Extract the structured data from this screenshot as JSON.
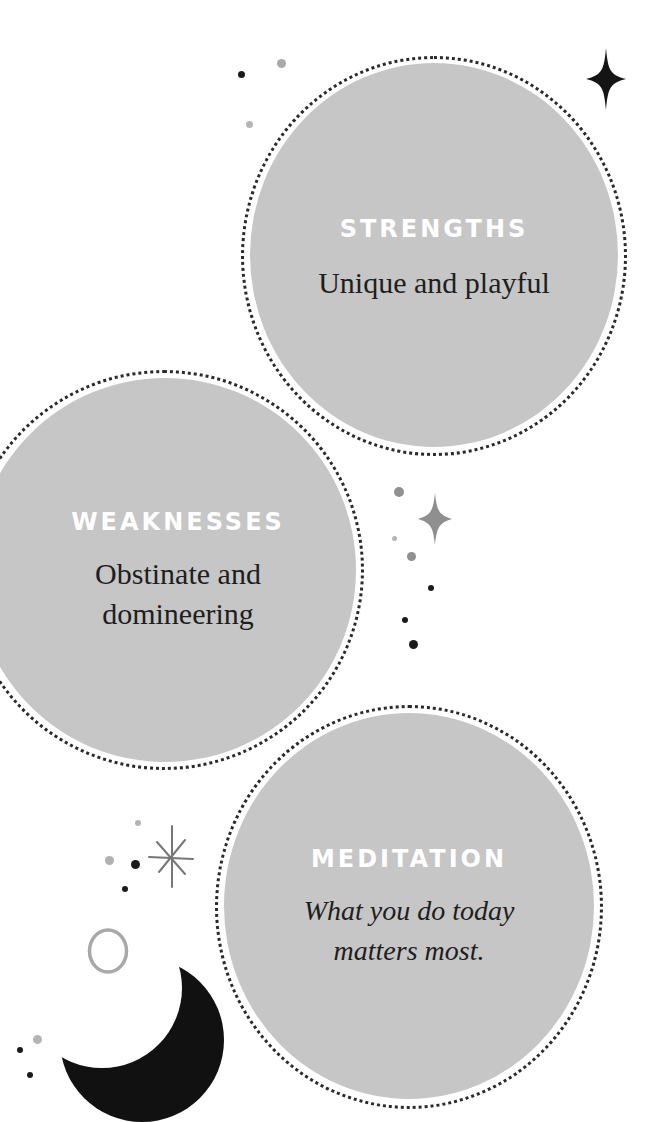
{
  "cards": [
    {
      "id": "strengths",
      "heading": "STRENGTHS",
      "text": "Unique and playful",
      "italic": false
    },
    {
      "id": "weaknesses",
      "heading": "WEAKNESSES",
      "text_lines": [
        "Obstinate and",
        "domineering"
      ],
      "italic": false
    },
    {
      "id": "meditation",
      "heading": "MEDITATION",
      "text_lines": [
        "What you do today",
        "matters most."
      ],
      "italic": true
    }
  ],
  "colors": {
    "disc_fill": "#c6c6c6",
    "ring": "#2a2a2a",
    "heading": "#ffffff",
    "body_text": "#1e1e1e",
    "dark_dot": "#1b1b1b",
    "light_dot": "#a9a9a9",
    "moon": "#111111"
  },
  "decorations": [
    "four-point-star-black",
    "four-point-star-grey",
    "asterisk-star",
    "crescent-moon",
    "ring-circle",
    "dots"
  ]
}
